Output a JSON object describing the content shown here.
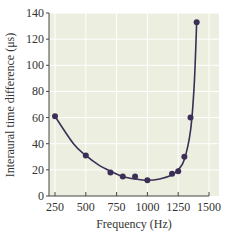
{
  "chart_data": {
    "type": "line",
    "title": "",
    "xlabel": "Frequency (Hz)",
    "ylabel": "Interaural time difference (μs)",
    "xlim": [
      230,
      1500
    ],
    "ylim": [
      0,
      140
    ],
    "xticks": [
      250,
      500,
      750,
      1000,
      1250,
      1500
    ],
    "yticks": [
      0,
      20,
      40,
      60,
      80,
      100,
      120,
      140
    ],
    "grid": true,
    "legend": null,
    "series": [
      {
        "name": "Measured",
        "style": "markers",
        "x": [
          250,
          500,
          700,
          800,
          900,
          1000,
          1200,
          1250,
          1300,
          1350,
          1400
        ],
        "y": [
          61,
          31,
          18,
          15,
          15,
          12,
          17,
          19,
          30,
          60,
          133
        ]
      },
      {
        "name": "Fit curve",
        "style": "line",
        "x": [
          250,
          400,
          500,
          600,
          700,
          800,
          900,
          1000,
          1100,
          1200,
          1250,
          1300,
          1350,
          1380,
          1400
        ],
        "y": [
          61,
          40,
          31,
          24,
          19,
          15,
          13,
          12,
          13,
          16,
          20,
          28,
          50,
          85,
          133
        ]
      }
    ],
    "colors": {
      "plot_background": "#eceee0",
      "grid": "#ffffff",
      "line": "#3c2f55",
      "marker": "#3c2f55",
      "axis": "#444444"
    }
  }
}
